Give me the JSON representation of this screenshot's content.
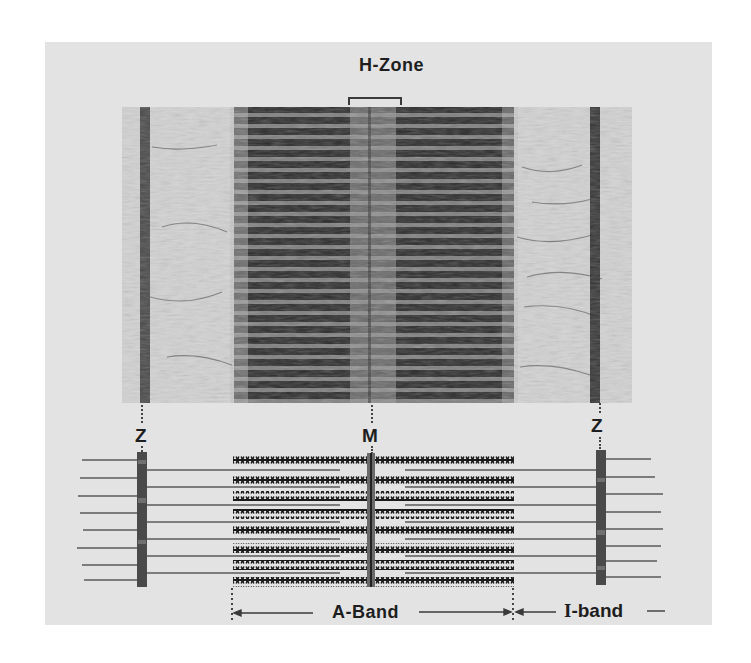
{
  "figure": {
    "labels": {
      "h_zone": "H-Zone",
      "z_left": "Z",
      "m_line": "M",
      "z_right": "Z",
      "a_band": "A-Band",
      "i_band_prefix": "I",
      "i_band_suffix": "-band"
    },
    "micrograph": {
      "description": "Electron micrograph of striated muscle sarcomere",
      "regions": [
        "Z-line",
        "I-band",
        "A-band",
        "H-zone",
        "M-line",
        "A-band",
        "I-band",
        "Z-line"
      ]
    },
    "schematic": {
      "thick_filament_rows": 8,
      "thin_filament_rows_per_side": 8,
      "components": [
        "Z disc (left)",
        "thin filaments (actin)",
        "thick filaments (myosin)",
        "M line",
        "Z disc (right)"
      ]
    },
    "colors": {
      "panel_background": "#e3e3e3",
      "ink": "#1e1e1e",
      "z_disc": "#555555",
      "thin_filament": "#555555",
      "thick_filament": "#1a1a1a"
    }
  }
}
